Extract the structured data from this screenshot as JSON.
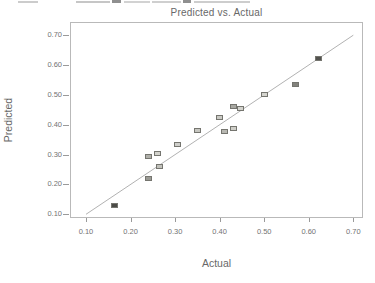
{
  "top_cropped_line": {
    "note": "bottom sliver of a cut-off text line, illegible except underscore marks",
    "segments": [
      {
        "x": 18,
        "y": 1,
        "w": 20,
        "h": 2,
        "color": "#cccccc"
      },
      {
        "x": 76,
        "y": 1,
        "w": 34,
        "h": 2,
        "color": "#c6c6c6"
      },
      {
        "x": 112,
        "y": 0,
        "w": 9,
        "h": 3,
        "color": "#8f8f8f"
      },
      {
        "x": 124,
        "y": 1,
        "w": 26,
        "h": 2,
        "color": "#d2d2d2"
      },
      {
        "x": 152,
        "y": 1,
        "w": 29,
        "h": 2,
        "color": "#cfcfcf"
      },
      {
        "x": 183,
        "y": 0,
        "w": 8,
        "h": 3,
        "color": "#8f8f8f"
      },
      {
        "x": 194,
        "y": 1,
        "w": 56,
        "h": 2,
        "color": "#cdcdcd"
      }
    ]
  },
  "chart_data": {
    "type": "scatter",
    "title": "Predicted vs. Actual",
    "xlabel": "Actual",
    "ylabel": "Predicted",
    "xlim": [
      0.064,
      0.722
    ],
    "ylim": [
      0.099,
      0.744
    ],
    "grid": false,
    "legend": "none",
    "xticks": [
      {
        "value": 0.1,
        "label": "0.10"
      },
      {
        "value": 0.2,
        "label": "0.20"
      },
      {
        "value": 0.3,
        "label": "0.30"
      },
      {
        "value": 0.4,
        "label": "0.40"
      },
      {
        "value": 0.5,
        "label": "0.50"
      },
      {
        "value": 0.6,
        "label": "0.60"
      },
      {
        "value": 0.7,
        "label": "0.70"
      }
    ],
    "yticks": [
      {
        "value": 0.7,
        "label": "0.70"
      },
      {
        "value": 0.6,
        "label": "0.60"
      },
      {
        "value": 0.5,
        "label": "0.50"
      },
      {
        "value": 0.4,
        "label": "0.40"
      },
      {
        "value": 0.3,
        "label": "0.30"
      },
      {
        "value": 0.2,
        "label": "0.20"
      },
      {
        "value": 0.1,
        "label": "0.10"
      }
    ],
    "identity_line": {
      "from": [
        0.1,
        0.1
      ],
      "to": [
        0.7,
        0.7
      ],
      "color": "#b2b2b2"
    },
    "points": [
      {
        "actual": 0.165,
        "predicted": 0.13,
        "fill": "#4b4b47"
      },
      {
        "actual": 0.24,
        "predicted": 0.22,
        "fill": "#9a9a94"
      },
      {
        "actual": 0.265,
        "predicted": 0.26,
        "fill": "#c2c2bc"
      },
      {
        "actual": 0.24,
        "predicted": 0.295,
        "fill": "#b0b0aa"
      },
      {
        "actual": 0.26,
        "predicted": 0.303,
        "fill": "#d2d2cc"
      },
      {
        "actual": 0.305,
        "predicted": 0.335,
        "fill": "#cececa"
      },
      {
        "actual": 0.35,
        "predicted": 0.38,
        "fill": "#c6c6c0"
      },
      {
        "actual": 0.4,
        "predicted": 0.425,
        "fill": "#cacac4"
      },
      {
        "actual": 0.41,
        "predicted": 0.376,
        "fill": "#b8b8b2"
      },
      {
        "actual": 0.432,
        "predicted": 0.387,
        "fill": "#cfcfc9"
      },
      {
        "actual": 0.43,
        "predicted": 0.46,
        "fill": "#a8a8a2"
      },
      {
        "actual": 0.447,
        "predicted": 0.455,
        "fill": "#d3d3cd"
      },
      {
        "actual": 0.5,
        "predicted": 0.5,
        "fill": "#d5d5cf"
      },
      {
        "actual": 0.57,
        "predicted": 0.535,
        "fill": "#83837d"
      },
      {
        "actual": 0.622,
        "predicted": 0.622,
        "fill": "#52524e"
      }
    ],
    "colors": {
      "frame": "#b9b9b9",
      "tick": "#9a9a9a",
      "tick_label": "#737373",
      "axis_label": "#686868",
      "title": "#686868",
      "marker_border": "#75756f",
      "background": "#ffffff"
    }
  }
}
